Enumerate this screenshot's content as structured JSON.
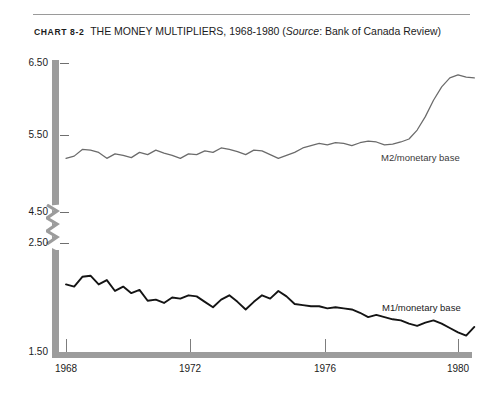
{
  "caption": {
    "chart_number": "CHART 8-2",
    "title": "THE MONEY MULTIPLIERS, 1968-1980",
    "source_open": "(",
    "source_word": "Source",
    "source_rest": ": Bank of Canada Review)"
  },
  "colors": {
    "axis": "#9c9c9c",
    "tick": "#6f6f6f",
    "m2_line": "#6b6b6b",
    "m1_line": "#141414",
    "rule": "#9a9a9a",
    "text": "#1c1c1c"
  },
  "chart_data": {
    "type": "line",
    "title": "THE MONEY MULTIPLIERS, 1968-1980",
    "subtitle": "Source: Bank of Canada Review",
    "xlabel": "",
    "ylabel": "",
    "grid": false,
    "legend_position": "inline-right",
    "xlim": [
      1968,
      1980.75
    ],
    "x_ticks": [
      1968,
      1972,
      1976,
      1980
    ],
    "x_tick_labels": [
      "1968",
      "1972",
      "1976",
      "1980"
    ],
    "y_ticks": [
      1.5,
      2.5,
      4.5,
      5.5,
      6.5
    ],
    "y_tick_labels": [
      "1.50",
      "2.50",
      "4.50",
      "5.50",
      "6.50"
    ],
    "y_axis_break": {
      "between": [
        2.5,
        4.5
      ],
      "note": "broken axis; upper panel 4.50-6.50, lower panel 1.50-2.50"
    },
    "series": [
      {
        "name": "M2/monetary base",
        "label": "M2/monetary base",
        "color": "#6b6b6b",
        "panel": "upper",
        "x": [
          1968.0,
          1968.25,
          1968.5,
          1968.75,
          1969.0,
          1969.25,
          1969.5,
          1969.75,
          1970.0,
          1970.25,
          1970.5,
          1970.75,
          1971.0,
          1971.25,
          1971.5,
          1971.75,
          1972.0,
          1972.25,
          1972.5,
          1972.75,
          1973.0,
          1973.25,
          1973.5,
          1973.75,
          1974.0,
          1974.25,
          1974.5,
          1974.75,
          1975.0,
          1975.25,
          1975.5,
          1975.75,
          1976.0,
          1976.25,
          1976.5,
          1976.75,
          1977.0,
          1977.25,
          1977.5,
          1977.75,
          1978.0,
          1978.25,
          1978.5,
          1978.75,
          1979.0,
          1979.25,
          1979.5,
          1979.75,
          1980.0,
          1980.25,
          1980.5
        ],
        "y": [
          5.22,
          5.25,
          5.34,
          5.33,
          5.3,
          5.22,
          5.28,
          5.26,
          5.23,
          5.3,
          5.27,
          5.33,
          5.29,
          5.26,
          5.22,
          5.28,
          5.27,
          5.32,
          5.3,
          5.36,
          5.34,
          5.31,
          5.27,
          5.33,
          5.32,
          5.27,
          5.22,
          5.26,
          5.3,
          5.36,
          5.39,
          5.42,
          5.4,
          5.43,
          5.42,
          5.39,
          5.43,
          5.45,
          5.44,
          5.4,
          5.41,
          5.44,
          5.48,
          5.6,
          5.78,
          6.0,
          6.18,
          6.3,
          6.34,
          6.31,
          6.3
        ]
      },
      {
        "name": "M1/monetary base",
        "label": "M1/monetary base",
        "color": "#141414",
        "panel": "lower",
        "x": [
          1968.0,
          1968.25,
          1968.5,
          1968.75,
          1969.0,
          1969.25,
          1969.5,
          1969.75,
          1970.0,
          1970.25,
          1970.5,
          1970.75,
          1971.0,
          1971.25,
          1971.5,
          1971.75,
          1972.0,
          1972.25,
          1972.5,
          1972.75,
          1973.0,
          1973.25,
          1973.5,
          1973.75,
          1974.0,
          1974.25,
          1974.5,
          1974.75,
          1975.0,
          1975.25,
          1975.5,
          1975.75,
          1976.0,
          1976.25,
          1976.5,
          1976.75,
          1977.0,
          1977.25,
          1977.5,
          1977.75,
          1978.0,
          1978.25,
          1978.5,
          1978.75,
          1979.0,
          1979.25,
          1979.5,
          1979.75,
          1980.0,
          1980.25,
          1980.5
        ],
        "y": [
          2.12,
          2.1,
          2.19,
          2.2,
          2.12,
          2.16,
          2.06,
          2.1,
          2.04,
          2.07,
          1.97,
          1.98,
          1.95,
          2.0,
          1.99,
          2.02,
          2.01,
          1.96,
          1.91,
          1.98,
          2.02,
          1.96,
          1.89,
          1.96,
          2.02,
          1.99,
          2.06,
          2.01,
          1.94,
          1.93,
          1.92,
          1.92,
          1.9,
          1.91,
          1.9,
          1.89,
          1.86,
          1.82,
          1.84,
          1.82,
          1.8,
          1.79,
          1.76,
          1.74,
          1.77,
          1.79,
          1.76,
          1.72,
          1.68,
          1.65,
          1.73
        ]
      }
    ]
  }
}
